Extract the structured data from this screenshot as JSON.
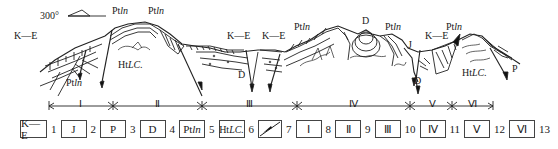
{
  "diagram": {
    "type": "geological cross-section",
    "orientation": {
      "label": "300°",
      "symbol": "direction-arrow"
    },
    "formation_labels": [
      {
        "id": "ke-left",
        "text": "K—E",
        "x": 14,
        "y": 35
      },
      {
        "id": "ptln-left-bottom",
        "text": "Pt",
        "italic": "ln",
        "x": 66,
        "y": 80
      },
      {
        "id": "ptln-top-1",
        "text": "Pt",
        "italic": "ln",
        "x": 110,
        "y": 10
      },
      {
        "id": "ptln-top-2",
        "text": "Pt",
        "italic": "ln",
        "x": 148,
        "y": 10
      },
      {
        "id": "htlc-left",
        "text": "Ht",
        "italic": "LC.",
        "x": 118,
        "y": 62
      },
      {
        "id": "ke-mid-1",
        "text": "K—E",
        "x": 240,
        "y": 35
      },
      {
        "id": "ke-mid-2",
        "text": "K—E",
        "x": 280,
        "y": 35
      },
      {
        "id": "d-mid",
        "text": "D",
        "x": 240,
        "y": 72
      },
      {
        "id": "ptln-mid",
        "text": "Pt",
        "italic": "ln",
        "x": 296,
        "y": 24
      },
      {
        "id": "d-right",
        "text": "D",
        "x": 365,
        "y": 18
      },
      {
        "id": "ptln-right-1",
        "text": "Pt",
        "italic": "ln",
        "x": 387,
        "y": 24
      },
      {
        "id": "j-right",
        "text": "J",
        "x": 410,
        "y": 42
      },
      {
        "id": "ke-right",
        "text": "K—E",
        "x": 427,
        "y": 32
      },
      {
        "id": "ptln-right-2",
        "text": "Pt",
        "italic": "ln",
        "x": 448,
        "y": 24
      },
      {
        "id": "htlc-right",
        "text": "Ht",
        "italic": "LC.",
        "x": 462,
        "y": 70
      },
      {
        "id": "p-right",
        "text": "P",
        "x": 527,
        "y": 62
      },
      {
        "id": "d-v",
        "text": "D",
        "x": 416,
        "y": 78
      }
    ],
    "sections": [
      {
        "label": "Ⅰ",
        "x": 80
      },
      {
        "label": "Ⅱ",
        "x": 156
      },
      {
        "label": "Ⅲ",
        "x": 246
      },
      {
        "label": "Ⅳ",
        "x": 346
      },
      {
        "label": "Ⅴ",
        "x": 433
      },
      {
        "label": "Ⅵ",
        "x": 470
      }
    ],
    "section_boundaries_x": [
      49,
      113,
      202,
      297,
      410,
      452,
      493
    ]
  },
  "legend": [
    {
      "symbol": "K—E",
      "number": "1",
      "width": 40
    },
    {
      "symbol": "J",
      "number": "2",
      "width": 34
    },
    {
      "symbol": "P",
      "number": "3",
      "width": 34
    },
    {
      "symbol": "D",
      "number": "4",
      "width": 34
    },
    {
      "symbol": "PtIn",
      "symbol_main": "Pt",
      "symbol_italic": "ln",
      "number": "5",
      "width": 34
    },
    {
      "symbol": "HtLC",
      "symbol_main": "Ht",
      "symbol_italic": "LC.",
      "number": "6",
      "width": 34
    },
    {
      "symbol": "fault-icon",
      "number": "7",
      "width": 30
    },
    {
      "symbol": "Ⅰ",
      "number": "8",
      "width": 34
    },
    {
      "symbol": "Ⅱ",
      "number": "9",
      "width": 34
    },
    {
      "symbol": "Ⅲ",
      "number": "10",
      "width": 34
    },
    {
      "symbol": "Ⅳ",
      "number": "11",
      "width": 34
    },
    {
      "symbol": "Ⅴ",
      "number": "12",
      "width": 34
    },
    {
      "symbol": "Ⅵ",
      "number": "13",
      "width": 34
    }
  ]
}
